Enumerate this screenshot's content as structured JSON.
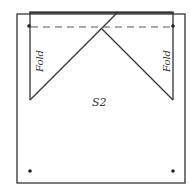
{
  "diagram": {
    "labels": {
      "left_fold": "Fold",
      "right_fold": "Fold",
      "center": "S2"
    },
    "colors": {
      "stroke": "#333333",
      "background": "#ffffff"
    }
  }
}
